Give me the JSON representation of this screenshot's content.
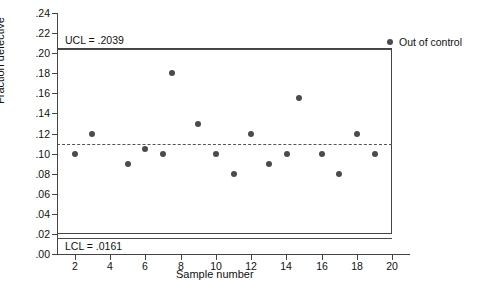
{
  "chart_data": {
    "type": "scatter",
    "title": "",
    "xlabel": "Sample number",
    "ylabel": "Fraction defective",
    "xlim": [
      1,
      21
    ],
    "ylim": [
      0.0,
      0.24
    ],
    "grid": false,
    "legend_position": "top-right",
    "legend": [
      {
        "label": "Out of control",
        "marker": "filled-circle",
        "color": "#4a4a52"
      }
    ],
    "y_ticks": [
      {
        "value": 0.0,
        "label": ".00"
      },
      {
        "value": 0.02,
        "label": ".02"
      },
      {
        "value": 0.04,
        "label": ".04"
      },
      {
        "value": 0.06,
        "label": ".06"
      },
      {
        "value": 0.08,
        "label": ".08"
      },
      {
        "value": 0.1,
        "label": ".10"
      },
      {
        "value": 0.12,
        "label": ".12"
      },
      {
        "value": 0.14,
        "label": ".14"
      },
      {
        "value": 0.16,
        "label": ".16"
      },
      {
        "value": 0.18,
        "label": ".18"
      },
      {
        "value": 0.2,
        "label": ".20"
      },
      {
        "value": 0.22,
        "label": ".22"
      },
      {
        "value": 0.24,
        "label": ".24"
      }
    ],
    "x_ticks": [
      {
        "value": 2,
        "label": "2"
      },
      {
        "value": 4,
        "label": "4"
      },
      {
        "value": 6,
        "label": "6"
      },
      {
        "value": 8,
        "label": "8"
      },
      {
        "value": 10,
        "label": "10"
      },
      {
        "value": 12,
        "label": "12"
      },
      {
        "value": 14,
        "label": "14"
      },
      {
        "value": 16,
        "label": "16"
      },
      {
        "value": 18,
        "label": "18"
      },
      {
        "value": 20,
        "label": "20"
      }
    ],
    "control_limits": {
      "ucl": {
        "value": 0.2039,
        "label": "UCL = .2039",
        "style": "solid"
      },
      "lcl": {
        "value": 0.0161,
        "label": "LCL = .0161",
        "style": "solid"
      },
      "center": {
        "value": 0.11,
        "label": "",
        "style": "dashed"
      }
    },
    "x": [
      2,
      3,
      5,
      6,
      7,
      7.5,
      9,
      10,
      11,
      12,
      13,
      14,
      14.7,
      16,
      17,
      18,
      19
    ],
    "y": [
      0.1,
      0.12,
      0.09,
      0.105,
      0.1,
      0.18,
      0.13,
      0.1,
      0.08,
      0.12,
      0.09,
      0.1,
      0.155,
      0.1,
      0.08,
      0.12,
      0.1
    ],
    "points": [
      {
        "x": 2,
        "y": 0.1
      },
      {
        "x": 3,
        "y": 0.12
      },
      {
        "x": 5,
        "y": 0.09
      },
      {
        "x": 6,
        "y": 0.105
      },
      {
        "x": 7,
        "y": 0.1
      },
      {
        "x": 7.5,
        "y": 0.18
      },
      {
        "x": 9,
        "y": 0.13
      },
      {
        "x": 10,
        "y": 0.1
      },
      {
        "x": 11,
        "y": 0.08
      },
      {
        "x": 12,
        "y": 0.12
      },
      {
        "x": 13,
        "y": 0.09
      },
      {
        "x": 14,
        "y": 0.1
      },
      {
        "x": 14.7,
        "y": 0.155
      },
      {
        "x": 16,
        "y": 0.1
      },
      {
        "x": 17,
        "y": 0.08
      },
      {
        "x": 18,
        "y": 0.12
      },
      {
        "x": 19,
        "y": 0.1
      }
    ],
    "colors": {
      "marker": "#4a4a52",
      "axis": "#444444",
      "limit_line": "#4a4a4a",
      "center_line": "#555555",
      "background": "#ffffff"
    }
  }
}
